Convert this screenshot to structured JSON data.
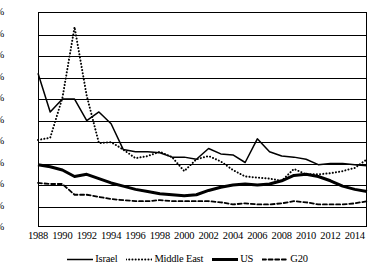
{
  "chart_data": {
    "type": "line",
    "title": "",
    "xlabel": "",
    "ylabel": "",
    "xlim": [
      1988,
      2015
    ],
    "ylim": [
      0,
      20
    ],
    "grid": "horizontal",
    "legend_position": "bottom",
    "y_tick_labels": [
      "20%",
      "18%",
      "16%",
      "14%",
      "12%",
      "10%",
      "8%",
      "6%",
      "4%",
      "2%",
      "0%"
    ],
    "y_tick_values": [
      20,
      18,
      16,
      14,
      12,
      10,
      8,
      6,
      4,
      2,
      0
    ],
    "x_tick_labels": [
      "1988",
      "1990",
      "1992",
      "1994",
      "1996",
      "1998",
      "2000",
      "2002",
      "2004",
      "2006",
      "2008",
      "2010",
      "2012",
      "2014"
    ],
    "x_tick_values": [
      1988,
      1990,
      1992,
      1994,
      1996,
      1998,
      2000,
      2002,
      2004,
      2006,
      2008,
      2010,
      2012,
      2014
    ],
    "x": [
      1988,
      1989,
      1990,
      1991,
      1992,
      1993,
      1994,
      1995,
      1996,
      1997,
      1998,
      1999,
      2000,
      2001,
      2002,
      2003,
      2004,
      2005,
      2006,
      2007,
      2008,
      2009,
      2010,
      2011,
      2012,
      2013,
      2014,
      2015
    ],
    "series": [
      {
        "name": "Israel",
        "style": "solid",
        "color": "#000000",
        "values": [
          14.3,
          10.7,
          11.9,
          11.9,
          9.9,
          10.7,
          9.6,
          7.2,
          7.0,
          7.0,
          6.9,
          6.5,
          6.5,
          6.3,
          7.3,
          6.8,
          6.7,
          6.0,
          8.2,
          7.0,
          6.6,
          6.5,
          6.3,
          5.8,
          5.9,
          5.9,
          5.8,
          5.7
        ]
      },
      {
        "name": "Middle East",
        "style": "dotted",
        "color": "#000000",
        "values": [
          8.1,
          8.3,
          12.0,
          18.6,
          12.2,
          7.8,
          7.9,
          7.2,
          6.4,
          6.6,
          7.0,
          6.5,
          5.2,
          6.3,
          6.6,
          6.1,
          5.3,
          4.7,
          4.6,
          4.5,
          4.3,
          5.4,
          4.9,
          4.9,
          5.0,
          5.2,
          5.5,
          6.3
        ]
      },
      {
        "name": "US",
        "style": "thick-solid",
        "color": "#000000",
        "values": [
          5.8,
          5.6,
          5.3,
          4.7,
          4.9,
          4.5,
          4.1,
          3.8,
          3.5,
          3.3,
          3.1,
          3.0,
          2.9,
          3.0,
          3.4,
          3.7,
          3.9,
          4.0,
          3.9,
          4.0,
          4.3,
          4.8,
          4.9,
          4.7,
          4.3,
          3.8,
          3.5,
          3.3
        ]
      },
      {
        "name": "G20",
        "style": "dashed",
        "color": "#000000",
        "values": [
          4.1,
          4.0,
          4.0,
          3.0,
          3.0,
          2.8,
          2.6,
          2.5,
          2.4,
          2.4,
          2.5,
          2.4,
          2.4,
          2.4,
          2.4,
          2.3,
          2.1,
          2.2,
          2.1,
          2.1,
          2.2,
          2.4,
          2.3,
          2.1,
          2.1,
          2.1,
          2.2,
          2.4
        ]
      }
    ]
  },
  "legend": {
    "items": [
      {
        "label": "Israel",
        "icon": "solid-line-swatch"
      },
      {
        "label": "Middle East",
        "icon": "dotted-line-swatch"
      },
      {
        "label": "US",
        "icon": "thick-line-swatch"
      },
      {
        "label": "G20",
        "icon": "dashed-line-swatch"
      }
    ]
  }
}
